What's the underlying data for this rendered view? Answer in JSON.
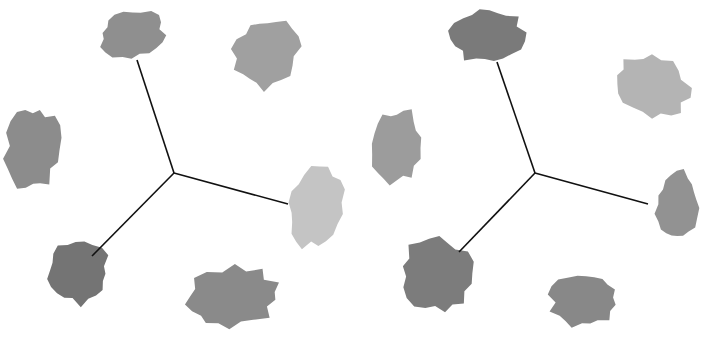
{
  "figure": {
    "panels": [
      {
        "id": "left",
        "center": [
          174,
          173
        ],
        "lines_to": [
          [
            137,
            60
          ],
          [
            288,
            204
          ],
          [
            92,
            256
          ]
        ],
        "swatches": [
          {
            "name": "top",
            "cx": 132,
            "cy": 34,
            "rx": 33,
            "ry": 24,
            "rot": -10,
            "color": "#8f8f8f"
          },
          {
            "name": "top-right",
            "cx": 266,
            "cy": 53,
            "rx": 32,
            "ry": 36,
            "rot": 25,
            "color": "#a0a0a0"
          },
          {
            "name": "left",
            "cx": 33,
            "cy": 148,
            "rx": 27,
            "ry": 42,
            "rot": 5,
            "color": "#8c8c8c"
          },
          {
            "name": "right",
            "cx": 315,
            "cy": 208,
            "rx": 27,
            "ry": 40,
            "rot": 12,
            "color": "#c4c4c4"
          },
          {
            "name": "bottom-left",
            "cx": 78,
            "cy": 272,
            "rx": 32,
            "ry": 32,
            "rot": 20,
            "color": "#747474"
          },
          {
            "name": "bottom-right",
            "cx": 232,
            "cy": 298,
            "rx": 48,
            "ry": 30,
            "rot": -8,
            "color": "#8a8a8a"
          }
        ]
      },
      {
        "id": "right",
        "center": [
          535,
          173
        ],
        "lines_to": [
          [
            497,
            62
          ],
          [
            648,
            204
          ],
          [
            459,
            252
          ]
        ],
        "swatches": [
          {
            "name": "top",
            "cx": 487,
            "cy": 36,
            "rx": 36,
            "ry": 28,
            "rot": -5,
            "color": "#7a7a7a"
          },
          {
            "name": "top-right",
            "cx": 652,
            "cy": 86,
            "rx": 38,
            "ry": 30,
            "rot": 30,
            "color": "#b4b4b4"
          },
          {
            "name": "left",
            "cx": 397,
            "cy": 146,
            "rx": 25,
            "ry": 38,
            "rot": 5,
            "color": "#9c9c9c"
          },
          {
            "name": "right",
            "cx": 677,
            "cy": 206,
            "rx": 22,
            "ry": 34,
            "rot": 5,
            "color": "#929292"
          },
          {
            "name": "bottom-left",
            "cx": 437,
            "cy": 275,
            "rx": 36,
            "ry": 38,
            "rot": -20,
            "color": "#7c7c7c"
          },
          {
            "name": "bottom-right",
            "cx": 584,
            "cy": 300,
            "rx": 34,
            "ry": 28,
            "rot": -5,
            "color": "#888888"
          }
        ]
      }
    ]
  }
}
